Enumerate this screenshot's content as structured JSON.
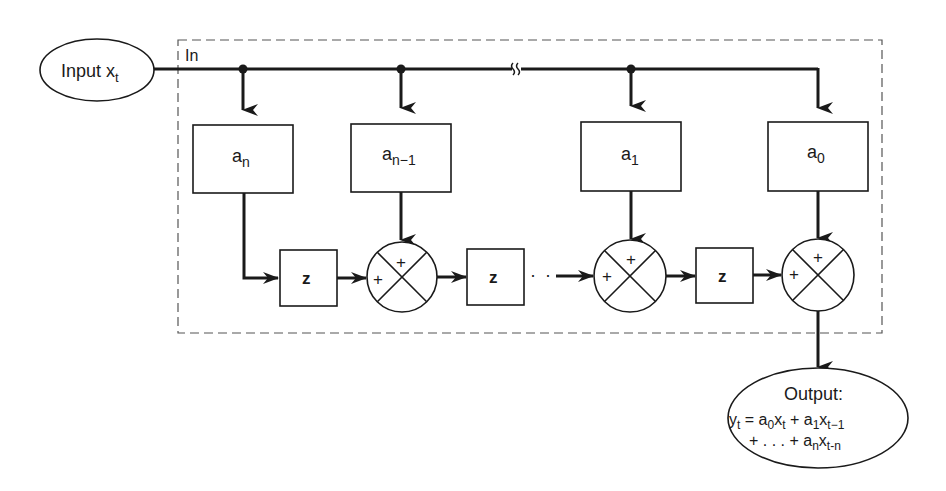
{
  "diagram": {
    "type": "block-diagram",
    "colors": {
      "stroke": "#1a1a1a",
      "background": "#ffffff",
      "dashed_box": "#555555"
    },
    "input": {
      "label": "Input",
      "var": "x",
      "sub": "t"
    },
    "enclosure": {
      "label": "In"
    },
    "coefficients": [
      {
        "id": "an",
        "base": "a",
        "sub": "n"
      },
      {
        "id": "an-1",
        "base": "a",
        "sub": "n−1"
      },
      {
        "id": "a1",
        "base": "a",
        "sub": "1"
      },
      {
        "id": "a0",
        "base": "a",
        "sub": "0"
      }
    ],
    "delays": [
      {
        "label": "z"
      },
      {
        "label": "z"
      },
      {
        "label": "z"
      }
    ],
    "summers": [
      {
        "top_sign": "+",
        "left_sign": "+"
      },
      {
        "top_sign": "+",
        "left_sign": "+"
      },
      {
        "top_sign": "+",
        "left_sign": "+"
      }
    ],
    "ellipsis": "· · ·",
    "output": {
      "title": "Output:",
      "line1": {
        "y": "y",
        "y_sub": "t",
        "eq": " = ",
        "a0": "a",
        "a0_sub": "0",
        "x0": "x",
        "x0_sub": "t",
        "plus": " + ",
        "a1": "a",
        "a1_sub": "1",
        "x1": "x",
        "x1_sub": "t−1"
      },
      "line2": {
        "lead": "+ . . . + ",
        "an": "a",
        "an_sub": "n",
        "xn": "x",
        "xn_sub": "t-n"
      }
    }
  }
}
